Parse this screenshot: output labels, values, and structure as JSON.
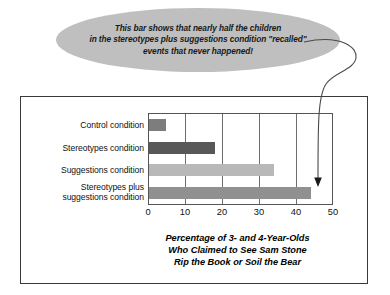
{
  "callout": {
    "line1": "This bar shows that nearly half the children",
    "line2": "in the stereotypes plus suggestions condition \"recalled\"",
    "line3": "events that never happened!",
    "fill_color": "#bfbfbf"
  },
  "chart_data": {
    "type": "bar",
    "orientation": "horizontal",
    "title": "",
    "categories": [
      "Control condition",
      "Stereotypes condition",
      "Suggestions condition",
      "Stereotypes plus suggestions condition"
    ],
    "category_lines": [
      [
        "Control condition"
      ],
      [
        "Stereotypes condition"
      ],
      [
        "Suggestions condition"
      ],
      [
        "Stereotypes plus",
        "suggestions condition"
      ]
    ],
    "values": [
      4.5,
      18,
      34,
      44
    ],
    "bar_colors": [
      "#7d7d7d",
      "#585858",
      "#b8b8b8",
      "#909090"
    ],
    "xlabel_lines": [
      "Percentage of 3- and 4-Year-Olds",
      "Who Claimed to See Sam Stone",
      "Rip the Book or Soil the Bear"
    ],
    "ylabel": "",
    "xlim": [
      0,
      50
    ],
    "xticks": [
      0,
      10,
      20,
      30,
      40,
      50
    ],
    "xtick_labels": [
      "0",
      "10",
      "20",
      "30",
      "40",
      "50"
    ],
    "grid": "vertical",
    "legend": "none",
    "annotation_target_category": "Stereotypes plus suggestions condition"
  }
}
